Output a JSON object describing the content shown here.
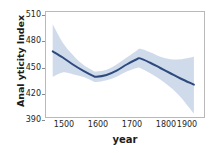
{
  "chart_data": {
    "type": "line",
    "title": "",
    "subtitle": "",
    "xlabel": "year",
    "ylabel": "Anal yticity Index",
    "xlim": [
      1450,
      1920
    ],
    "ylim": [
      390,
      510
    ],
    "xticks": [
      "1500",
      "1600",
      "1700",
      "1800",
      "1900"
    ],
    "xtick_values": [
      1500,
      1600,
      1700,
      1800,
      1900
    ],
    "yticks": [
      "390",
      "420",
      "450",
      "480",
      "510"
    ],
    "ytick_values": [
      390,
      420,
      450,
      480,
      510
    ],
    "grid": false,
    "legend": "none",
    "line_color": "#2e4a7d",
    "band_color": "#ccd8ea",
    "frame_color": "#b9b9b9",
    "background_color": "#ffffff",
    "series": [
      {
        "name": "Analyticity Index (smoothed trend)",
        "x": [
          1470,
          1500,
          1530,
          1560,
          1590,
          1600,
          1630,
          1660,
          1690,
          1720,
          1730,
          1760,
          1790,
          1820,
          1850,
          1890
        ],
        "values": [
          465,
          458,
          450,
          443,
          437,
          436,
          438,
          443,
          450,
          456,
          457,
          452,
          446,
          440,
          434,
          427
        ],
        "band_upper": [
          496,
          475,
          461,
          450,
          443,
          442,
          444,
          450,
          458,
          466,
          468,
          464,
          459,
          456,
          456,
          459
        ],
        "band_lower": [
          436,
          441,
          439,
          436,
          431,
          430,
          432,
          436,
          442,
          446,
          446,
          440,
          433,
          424,
          413,
          394
        ]
      }
    ]
  }
}
